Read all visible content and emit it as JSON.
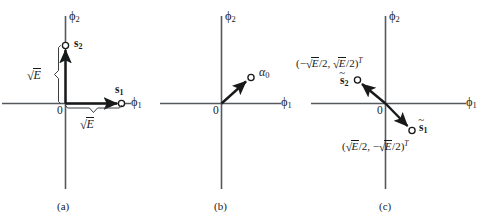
{
  "figure": {
    "background_color": "#ffffff",
    "axis_color": "#55595c",
    "vector_color": "#18191a"
  },
  "panels": [
    {
      "id": "a",
      "caption": "(a)",
      "origin_label": "0",
      "x_axis_label": "ϕ",
      "x_axis_sub": "1",
      "y_axis_label": "ϕ",
      "y_axis_sub": "2",
      "points": [
        {
          "name": "s1",
          "label": "s",
          "sub": "1"
        },
        {
          "name": "s2",
          "label": "s",
          "sub": "2"
        }
      ],
      "measures": [
        {
          "name": "vertical-brace",
          "radical_sign": "√",
          "radicand": "E"
        },
        {
          "name": "horizontal-brace",
          "radical_sign": "√",
          "radicand": "E"
        }
      ]
    },
    {
      "id": "b",
      "caption": "(b)",
      "origin_label": "0",
      "x_axis_label": "ϕ",
      "x_axis_sub": "1",
      "y_axis_label": "ϕ",
      "y_axis_sub": "2",
      "points": [
        {
          "name": "alpha0",
          "label": "α",
          "sub": "0"
        }
      ]
    },
    {
      "id": "c",
      "caption": "(c)",
      "origin_label": "0",
      "x_axis_label": "ϕ",
      "x_axis_sub": "1",
      "y_axis_label": "ϕ",
      "y_axis_sub": "2",
      "points": [
        {
          "name": "s1-tilde",
          "label": "s",
          "sub": "1",
          "accent": "~"
        },
        {
          "name": "s2-tilde",
          "label": "s",
          "sub": "2",
          "accent": "~"
        }
      ],
      "coordinates": {
        "s2_tilde": {
          "open": "(−",
          "radical_sign": "√",
          "radicand1": "E",
          "div1": "/2, ",
          "radicand2": "E",
          "div2": "/2)",
          "transpose": "T"
        },
        "s1_tilde": {
          "open": "(",
          "radical_sign": "√",
          "radicand1": "E",
          "div1": "/2, −",
          "radicand2": "E",
          "div2": "/2)",
          "transpose": "T"
        }
      }
    }
  ]
}
